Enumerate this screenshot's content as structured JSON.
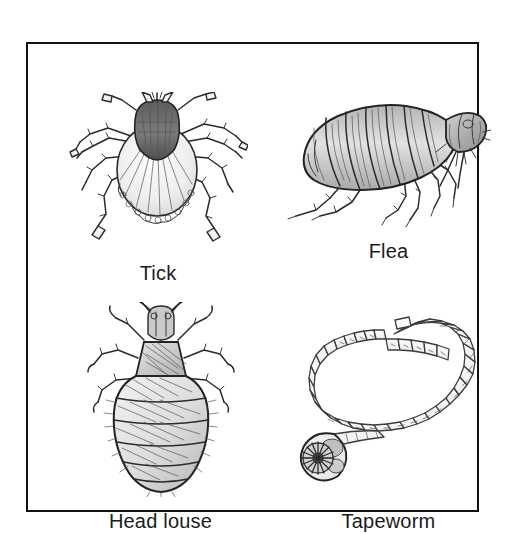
{
  "figure": {
    "border_color": "#111111",
    "background_color": "#ffffff",
    "ink_color": "#2b2b2b",
    "style": "pencil sketch line drawing with graphite shading"
  },
  "panels": [
    {
      "id": "tick",
      "label": "Tick",
      "icon": "tick-illustration",
      "position": "top-left",
      "description": "Dorsal view of a hard tick with dark shield (scutum), oval striated body, scalloped festoons along rear margin and eight legs"
    },
    {
      "id": "flea",
      "label": "Flea",
      "icon": "flea-illustration",
      "position": "top-right",
      "description": "Lateral view of a flea, laterally compressed segmented body, head at right, long hind legs extending downward"
    },
    {
      "id": "head-louse",
      "label": "Head louse",
      "icon": "head-louse-illustration",
      "position": "bottom-left",
      "description": "Dorsal view of a head louse with antennae, trapezoidal thorax, six segmented abdomen bands and six clawed legs"
    },
    {
      "id": "tapeworm",
      "label": "Tapeworm",
      "icon": "tapeworm-illustration",
      "position": "bottom-right",
      "description": "Curved chain of proglottid segments with a rounded scolex bearing a rosette of hooks, plus one detached segment"
    }
  ]
}
